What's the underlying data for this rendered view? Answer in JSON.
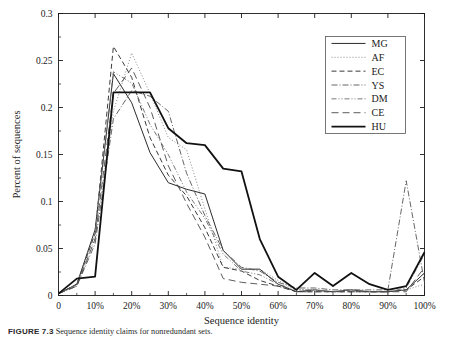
{
  "figure": {
    "caption_label": "FIGURE 7.3",
    "caption_text": "Sequence identity claims for nonredundant sets."
  },
  "chart_data": {
    "type": "line",
    "title": "",
    "xlabel": "Sequence identity",
    "ylabel": "Percent of sequences",
    "xlim": [
      0,
      100
    ],
    "ylim": [
      0,
      0.3
    ],
    "xticks": [
      0,
      10,
      20,
      30,
      40,
      50,
      60,
      70,
      80,
      90,
      100
    ],
    "xtick_labels": [
      "0",
      "10%",
      "20%",
      "30%",
      "40%",
      "50%",
      "60%",
      "70%",
      "80%",
      "90%",
      "100%"
    ],
    "yticks": [
      0,
      0.05,
      0.1,
      0.15,
      0.2,
      0.25,
      0.3
    ],
    "ytick_labels": [
      "0",
      "0.05",
      "0.1",
      "0.15",
      "0.2",
      "0.25",
      "0.3"
    ],
    "grid": false,
    "minor_xticks": [
      5,
      15,
      25,
      35,
      45,
      55,
      65,
      75,
      85,
      95
    ],
    "minor_yticks": [
      0.025,
      0.075,
      0.125,
      0.175,
      0.225,
      0.275
    ],
    "legend_position": "top-right",
    "x": [
      0,
      5,
      10,
      15,
      20,
      25,
      30,
      35,
      40,
      45,
      50,
      55,
      60,
      65,
      70,
      75,
      80,
      85,
      90,
      95,
      100
    ],
    "series": [
      {
        "name": "MG",
        "color": "#2b2b2b",
        "width": 1.0,
        "dash": "none",
        "values": [
          0.002,
          0.012,
          0.07,
          0.236,
          0.205,
          0.152,
          0.12,
          0.113,
          0.108,
          0.048,
          0.028,
          0.028,
          0.012,
          0.004,
          0.006,
          0.004,
          0.006,
          0.004,
          0.004,
          0.006,
          0.024
        ]
      },
      {
        "name": "AF",
        "color": "#7a7a7a",
        "width": 0.9,
        "dash": "1,2",
        "values": [
          0.002,
          0.01,
          0.062,
          0.196,
          0.258,
          0.215,
          0.168,
          0.155,
          0.092,
          0.03,
          0.028,
          0.028,
          0.016,
          0.006,
          0.006,
          0.004,
          0.004,
          0.004,
          0.004,
          0.006,
          0.012
        ]
      },
      {
        "name": "EC",
        "color": "#3a3a3a",
        "width": 1.0,
        "dash": "5,3",
        "values": [
          0.002,
          0.012,
          0.066,
          0.265,
          0.232,
          0.168,
          0.128,
          0.106,
          0.072,
          0.03,
          0.026,
          0.016,
          0.01,
          0.004,
          0.004,
          0.004,
          0.004,
          0.004,
          0.004,
          0.006,
          0.02
        ]
      },
      {
        "name": "YS",
        "color": "#555555",
        "width": 0.9,
        "dash": "6,2,1,2",
        "values": [
          0.002,
          0.01,
          0.055,
          0.188,
          0.218,
          0.212,
          0.196,
          0.13,
          0.085,
          0.048,
          0.03,
          0.026,
          0.014,
          0.008,
          0.008,
          0.006,
          0.006,
          0.006,
          0.006,
          0.122,
          0.014
        ]
      },
      {
        "name": "DM",
        "color": "#6a6a6a",
        "width": 0.9,
        "dash": "5,2,1,2,1,2",
        "values": [
          0.002,
          0.012,
          0.068,
          0.238,
          0.226,
          0.182,
          0.15,
          0.11,
          0.082,
          0.044,
          0.026,
          0.022,
          0.012,
          0.006,
          0.006,
          0.004,
          0.006,
          0.004,
          0.004,
          0.008,
          0.044
        ]
      },
      {
        "name": "CE",
        "color": "#4a4a4a",
        "width": 0.9,
        "dash": "7,4",
        "values": [
          0.002,
          0.01,
          0.06,
          0.215,
          0.242,
          0.2,
          0.138,
          0.098,
          0.062,
          0.018,
          0.014,
          0.012,
          0.01,
          0.004,
          0.004,
          0.004,
          0.004,
          0.004,
          0.004,
          0.004,
          0.03
        ]
      },
      {
        "name": "HU",
        "color": "#111111",
        "width": 1.8,
        "dash": "none",
        "values": [
          0.002,
          0.018,
          0.02,
          0.216,
          0.216,
          0.216,
          0.178,
          0.162,
          0.16,
          0.135,
          0.132,
          0.06,
          0.02,
          0.006,
          0.024,
          0.01,
          0.024,
          0.012,
          0.006,
          0.01,
          0.046
        ]
      }
    ]
  },
  "legend": {
    "entries": [
      {
        "label": "MG"
      },
      {
        "label": "AF"
      },
      {
        "label": "EC"
      },
      {
        "label": "YS"
      },
      {
        "label": "DM"
      },
      {
        "label": "CE"
      },
      {
        "label": "HU"
      }
    ]
  }
}
